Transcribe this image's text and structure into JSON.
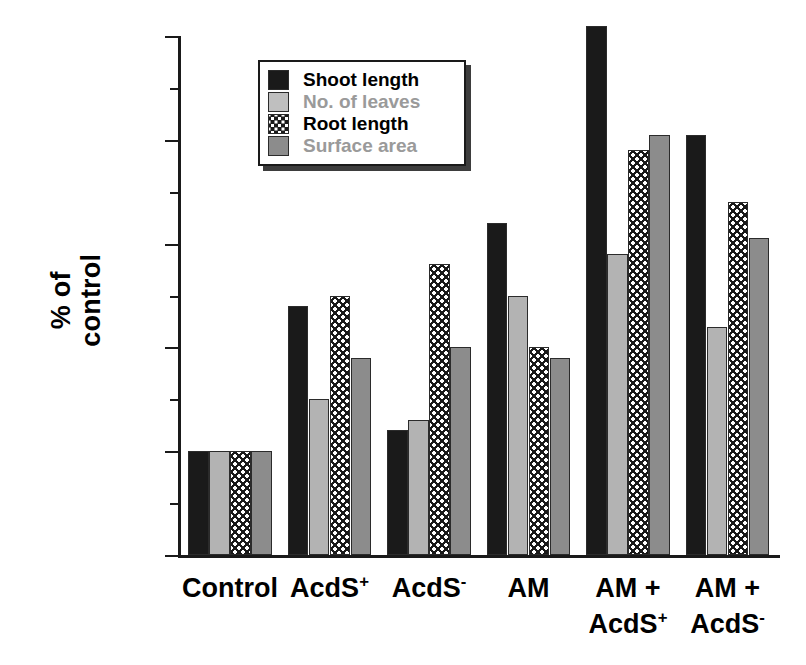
{
  "chart_data": {
    "type": "bar",
    "title": "",
    "xlabel": "",
    "ylabel": "% of\ncontrol",
    "ylim": [
      90,
      140
    ],
    "ytick_major": [
      90,
      100,
      110,
      120,
      130,
      140
    ],
    "ytick_minor": [
      95,
      105,
      115,
      125,
      135
    ],
    "ytick_labels": [
      "90",
      "100",
      "110",
      "120",
      "130",
      "140"
    ],
    "grid": false,
    "legend_position": "top-left-inside",
    "categories": [
      "Control",
      "AcdS+",
      "AcdS-",
      "AM",
      "AM +\nAcdS+",
      "AM +\nAcdS-"
    ],
    "category_labels": [
      {
        "line1": "Control",
        "line1_sup": "",
        "line2": "",
        "line2_sup": ""
      },
      {
        "line1": "AcdS",
        "line1_sup": "+",
        "line2": "",
        "line2_sup": ""
      },
      {
        "line1": "AcdS",
        "line1_sup": "-",
        "line2": "",
        "line2_sup": ""
      },
      {
        "line1": "AM",
        "line1_sup": "",
        "line2": "",
        "line2_sup": ""
      },
      {
        "line1": "AM +",
        "line1_sup": "",
        "line2": "AcdS",
        "line2_sup": "+"
      },
      {
        "line1": "AM +",
        "line1_sup": "",
        "line2": "AcdS",
        "line2_sup": "-"
      }
    ],
    "series": [
      {
        "name": "Shoot length",
        "key": "shoot",
        "color": "#1a1a1a",
        "pattern": "solid",
        "values": [
          100,
          114,
          102,
          122,
          141,
          130.5
        ]
      },
      {
        "name": "No. of leaves",
        "key": "leaves",
        "color": "#b3b3b3",
        "pattern": "solid",
        "values": [
          100,
          105,
          103,
          115,
          119,
          112
        ]
      },
      {
        "name": "Root length",
        "key": "root",
        "color": "#1a1a1a",
        "pattern": "dotted",
        "values": [
          100,
          115,
          118,
          110,
          129,
          124
        ]
      },
      {
        "name": "Surface area",
        "key": "surface",
        "color": "#8c8c8c",
        "pattern": "solid",
        "values": [
          100,
          109,
          110,
          109,
          130.5,
          120.5
        ]
      }
    ]
  },
  "legend": {
    "items": [
      {
        "label": "Shoot length",
        "swatch": "shoot"
      },
      {
        "label": "No. of leaves",
        "swatch": "leaves"
      },
      {
        "label": "Root length",
        "swatch": "root"
      },
      {
        "label": "Surface area",
        "swatch": "surface"
      }
    ]
  },
  "colors": {
    "shoot": "#1a1a1a",
    "leaves": "#b3b3b3",
    "root": "#1a1a1a",
    "surface": "#8c8c8c",
    "axis": "#1a1a1a",
    "background": "#ffffff"
  }
}
